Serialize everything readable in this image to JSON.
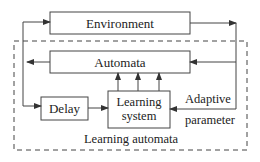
{
  "diagram": {
    "blocks": {
      "environment": "Environment",
      "automata": "Automata",
      "delay": "Delay",
      "learning_system_line1": "Learning",
      "learning_system_line2": "system"
    },
    "labels": {
      "adaptive_line1": "Adaptive",
      "adaptive_line2": "parameter",
      "group": "Learning automata"
    },
    "colors": {
      "stroke": "#444444",
      "background": "#ffffff"
    }
  }
}
